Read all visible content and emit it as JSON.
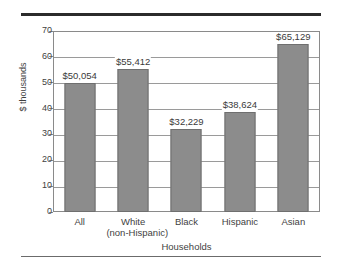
{
  "chart_data": {
    "type": "bar",
    "title": "",
    "subtitle": "",
    "xlabel": "Households",
    "ylabel": "$ thousands",
    "categories": [
      "All",
      "White\n(non-Hispanic)",
      "Black",
      "Hispanic",
      "Asian"
    ],
    "category_lines": [
      [
        "All"
      ],
      [
        "White",
        "(non-Hispanic)"
      ],
      [
        "Black"
      ],
      [
        "Hispanic"
      ],
      [
        "Asian"
      ]
    ],
    "values": [
      50.054,
      55.412,
      32.229,
      38.624,
      65.129
    ],
    "value_labels": [
      "$50,054",
      "$55,412",
      "$32,229",
      "$38,624",
      "$65,129"
    ],
    "ylim": [
      0,
      70
    ],
    "ytick_values": [
      0,
      10,
      20,
      30,
      40,
      50,
      60,
      70
    ],
    "ytick_labels": [
      "0",
      "10",
      "20",
      "30",
      "40",
      "50",
      "60",
      "70"
    ],
    "grid": "horizontal",
    "legend": "none",
    "bar_color": "#8c8c8c",
    "bar_edge_color": "#6f6f6f",
    "axis_color": "#8a8a8a",
    "background_color": "#ffffff",
    "text_color": "#3f3f3f"
  },
  "decor": {
    "top_rule_color": "#2b2b2b",
    "bottom_rule_color": "#6b6b6b"
  }
}
